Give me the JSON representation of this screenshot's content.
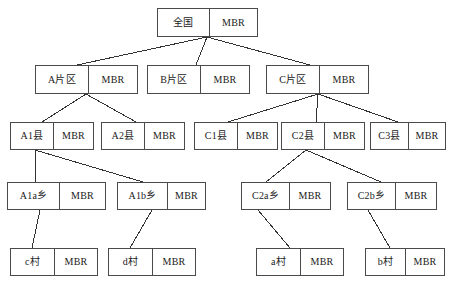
{
  "diagram": {
    "mbr_label": "MBR",
    "colors": {
      "border": "#4a4a4a",
      "background": "#ffffff",
      "text": "#1a1a1a",
      "edge": "#333333"
    },
    "levels": [
      {
        "level": 1,
        "name": "nation"
      },
      {
        "level": 2,
        "name": "region"
      },
      {
        "level": 3,
        "name": "county"
      },
      {
        "level": 4,
        "name": "township"
      },
      {
        "level": 5,
        "name": "village"
      }
    ],
    "nodes": [
      {
        "id": "root",
        "label": "全国",
        "mbr": "MBR",
        "level": 1,
        "x": 157,
        "y": 8,
        "w": 101,
        "h": 29,
        "name_w": 52
      },
      {
        "id": "a",
        "label": "A片区",
        "mbr": "MBR",
        "level": 2,
        "x": 35,
        "y": 65,
        "w": 103,
        "h": 29,
        "name_w": 53
      },
      {
        "id": "b",
        "label": "B片区",
        "mbr": "MBR",
        "level": 2,
        "x": 147,
        "y": 65,
        "w": 103,
        "h": 29,
        "name_w": 53
      },
      {
        "id": "c",
        "label": "C片区",
        "mbr": "MBR",
        "level": 2,
        "x": 266,
        "y": 65,
        "w": 103,
        "h": 29,
        "name_w": 53
      },
      {
        "id": "a1",
        "label": "A1县",
        "mbr": "MBR",
        "level": 3,
        "x": 10,
        "y": 122,
        "w": 84,
        "h": 28,
        "name_w": 43
      },
      {
        "id": "a2",
        "label": "A2县",
        "mbr": "MBR",
        "level": 3,
        "x": 101,
        "y": 122,
        "w": 84,
        "h": 28,
        "name_w": 43
      },
      {
        "id": "c1",
        "label": "C1县",
        "mbr": "MBR",
        "level": 3,
        "x": 194,
        "y": 122,
        "w": 84,
        "h": 28,
        "name_w": 43
      },
      {
        "id": "c2",
        "label": "C2县",
        "mbr": "MBR",
        "level": 3,
        "x": 281,
        "y": 122,
        "w": 84,
        "h": 28,
        "name_w": 43
      },
      {
        "id": "c3",
        "label": "C3县",
        "mbr": "MBR",
        "level": 3,
        "x": 370,
        "y": 122,
        "w": 76,
        "h": 28,
        "name_w": 38
      },
      {
        "id": "a1a",
        "label": "A1a乡",
        "mbr": "MBR",
        "level": 4,
        "x": 7,
        "y": 182,
        "w": 99,
        "h": 28,
        "name_w": 52
      },
      {
        "id": "a1b",
        "label": "A1b乡",
        "mbr": "MBR",
        "level": 4,
        "x": 117,
        "y": 182,
        "w": 89,
        "h": 28,
        "name_w": 50
      },
      {
        "id": "c2a",
        "label": "C2a乡",
        "mbr": "MBR",
        "level": 4,
        "x": 241,
        "y": 182,
        "w": 90,
        "h": 28,
        "name_w": 48
      },
      {
        "id": "c2b",
        "label": "C2b乡",
        "mbr": "MBR",
        "level": 4,
        "x": 347,
        "y": 182,
        "w": 90,
        "h": 28,
        "name_w": 48
      },
      {
        "id": "vc",
        "label": "c村",
        "mbr": "MBR",
        "level": 5,
        "x": 10,
        "y": 248,
        "w": 88,
        "h": 28,
        "name_w": 44
      },
      {
        "id": "vd",
        "label": "d村",
        "mbr": "MBR",
        "level": 5,
        "x": 108,
        "y": 248,
        "w": 88,
        "h": 28,
        "name_w": 44
      },
      {
        "id": "va",
        "label": "a村",
        "mbr": "MBR",
        "level": 5,
        "x": 256,
        "y": 248,
        "w": 88,
        "h": 28,
        "name_w": 44
      },
      {
        "id": "vb",
        "label": "b村",
        "mbr": "MBR",
        "level": 5,
        "x": 365,
        "y": 248,
        "w": 80,
        "h": 28,
        "name_w": 40
      }
    ],
    "edges": [
      {
        "from": "root",
        "to": "a",
        "x1": 207,
        "y1": 37,
        "x2": 77,
        "y2": 65
      },
      {
        "from": "root",
        "to": "b",
        "x1": 207,
        "y1": 37,
        "x2": 196,
        "y2": 65
      },
      {
        "from": "root",
        "to": "c",
        "x1": 207,
        "y1": 37,
        "x2": 310,
        "y2": 65
      },
      {
        "from": "a",
        "to": "a1",
        "x1": 86,
        "y1": 94,
        "x2": 42,
        "y2": 122
      },
      {
        "from": "a",
        "to": "a2",
        "x1": 86,
        "y1": 94,
        "x2": 136,
        "y2": 122
      },
      {
        "from": "c",
        "to": "c1",
        "x1": 318,
        "y1": 94,
        "x2": 228,
        "y2": 122
      },
      {
        "from": "c",
        "to": "c2",
        "x1": 318,
        "y1": 94,
        "x2": 316,
        "y2": 122
      },
      {
        "from": "c",
        "to": "c3",
        "x1": 318,
        "y1": 94,
        "x2": 398,
        "y2": 122
      },
      {
        "from": "a1",
        "to": "a1a",
        "x1": 35,
        "y1": 150,
        "x2": 35,
        "y2": 182
      },
      {
        "from": "a1",
        "to": "a1b",
        "x1": 35,
        "y1": 150,
        "x2": 143,
        "y2": 182
      },
      {
        "from": "c2",
        "to": "c2a",
        "x1": 306,
        "y1": 150,
        "x2": 266,
        "y2": 182
      },
      {
        "from": "c2",
        "to": "c2b",
        "x1": 306,
        "y1": 150,
        "x2": 381,
        "y2": 182
      },
      {
        "from": "a1a",
        "to": "vc",
        "x1": 40,
        "y1": 210,
        "x2": 32,
        "y2": 248
      },
      {
        "from": "a1b",
        "to": "vd",
        "x1": 152,
        "y1": 210,
        "x2": 130,
        "y2": 248
      },
      {
        "from": "c2a",
        "to": "va",
        "x1": 258,
        "y1": 210,
        "x2": 290,
        "y2": 248
      },
      {
        "from": "c2b",
        "to": "vb",
        "x1": 368,
        "y1": 210,
        "x2": 390,
        "y2": 248
      }
    ]
  }
}
